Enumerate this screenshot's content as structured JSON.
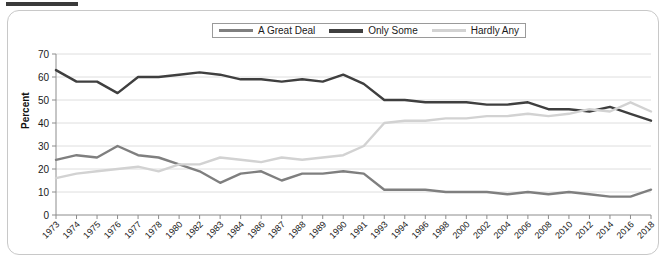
{
  "figure": {
    "top_tag_present": true,
    "border_color": "#c8c8c8"
  },
  "legend": {
    "position": "top-center",
    "entries": [
      {
        "label": "A Great Deal",
        "color": "#7f7f7f"
      },
      {
        "label": "Only Some",
        "color": "#3f3f3f"
      },
      {
        "label": "Hardly Any",
        "color": "#d2d2d2"
      }
    ]
  },
  "axes": {
    "ylabel": "Percent",
    "yticks": [
      "0",
      "10",
      "20",
      "30",
      "40",
      "50",
      "60",
      "70"
    ]
  },
  "chart_data": {
    "type": "line",
    "title": "",
    "xlabel": "",
    "ylabel": "Percent",
    "ylim": [
      0,
      70
    ],
    "ytick_step": 10,
    "grid": true,
    "legend_position": "top-center",
    "categories": [
      "1973",
      "1974",
      "1975",
      "1976",
      "1977",
      "1978",
      "1980",
      "1982",
      "1983",
      "1984",
      "1986",
      "1987",
      "1988",
      "1989",
      "1990",
      "1991",
      "1993",
      "1994",
      "1996",
      "1998",
      "2000",
      "2002",
      "2004",
      "2006",
      "2008",
      "2010",
      "2012",
      "2014",
      "2016",
      "2018"
    ],
    "series": [
      {
        "name": "A Great Deal",
        "color": "#7f7f7f",
        "values": [
          24,
          26,
          25,
          30,
          26,
          25,
          22,
          19,
          14,
          18,
          19,
          15,
          18,
          18,
          19,
          18,
          11,
          11,
          11,
          10,
          10,
          10,
          9,
          10,
          9,
          10,
          9,
          8,
          8,
          11
        ]
      },
      {
        "name": "Only Some",
        "color": "#3f3f3f",
        "values": [
          63,
          58,
          58,
          53,
          60,
          60,
          61,
          62,
          61,
          59,
          59,
          58,
          59,
          58,
          61,
          57,
          50,
          50,
          49,
          49,
          49,
          48,
          48,
          49,
          46,
          46,
          45,
          47,
          44,
          41
        ]
      },
      {
        "name": "Hardly Any",
        "color": "#d2d2d2",
        "values": [
          16,
          18,
          19,
          20,
          21,
          19,
          22,
          22,
          25,
          24,
          23,
          25,
          24,
          25,
          26,
          30,
          40,
          41,
          41,
          42,
          42,
          43,
          43,
          44,
          43,
          44,
          46,
          45,
          49,
          45
        ]
      }
    ]
  }
}
